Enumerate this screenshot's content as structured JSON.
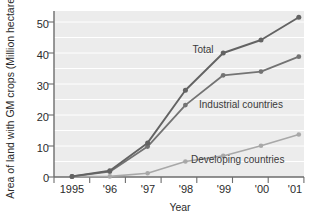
{
  "chart_data": {
    "type": "line",
    "title": "",
    "xlabel": "Year",
    "ylabel": "Area of land with GM crops (Million hectares)",
    "categories": [
      "1995",
      "'96",
      "'97",
      "'98",
      "'99",
      "'00",
      "'01"
    ],
    "x": [
      1995,
      1996,
      1997,
      1998,
      1999,
      2000,
      2001
    ],
    "xlim": [
      1995,
      2001
    ],
    "ylim": [
      0,
      55
    ],
    "yticks": [
      0,
      10,
      20,
      30,
      40,
      50
    ],
    "ytick_labels": [
      "0",
      "10",
      "20",
      "30",
      "40",
      "50"
    ],
    "grid": true,
    "grid_interval": 5,
    "legend_position": "inline-annotations",
    "series": [
      {
        "name": "Total",
        "color": "#636363",
        "values": [
          0.2,
          2.0,
          11.0,
          28.0,
          40.0,
          44.2,
          51.5
        ]
      },
      {
        "name": "Industrial countries",
        "color": "#737373",
        "values": [
          0.2,
          1.7,
          9.8,
          23.2,
          32.8,
          34.0,
          38.8
        ]
      },
      {
        "name": "Developing countries",
        "color": "#a8a8a8",
        "values": [
          0.1,
          0.2,
          1.2,
          5.0,
          6.8,
          10.1,
          13.7
        ]
      }
    ],
    "annotations": [
      {
        "text": "Total",
        "series": "Total",
        "x_px": 203,
        "y_px": 53
      },
      {
        "text": "Industrial countries",
        "series": "Industrial countries",
        "x_px": 199,
        "y_px": 108
      },
      {
        "text": "Developing countries",
        "series": "Developing countries",
        "x_px": 191,
        "y_px": 163
      }
    ]
  },
  "axes": {
    "y_axis_title": "Area of land with GM crops (Million hectares)",
    "x_axis_title": "Year",
    "y_tick_0": "0",
    "y_tick_1": "10",
    "y_tick_2": "20",
    "y_tick_3": "30",
    "y_tick_4": "40",
    "y_tick_5": "50",
    "x_tick_0": "1995",
    "x_tick_1": "'96",
    "x_tick_2": "'97",
    "x_tick_3": "'98",
    "x_tick_4": "'99",
    "x_tick_5": "'00",
    "x_tick_6": "'01"
  },
  "series_labels": {
    "total": "Total",
    "industrial": "Industrial countries",
    "developing": "Developing countries"
  },
  "colors": {
    "plot_background": "#ececec",
    "gridline": "#ffffff",
    "axis": "#6d6d6d",
    "total": "#636363",
    "industrial": "#737373",
    "developing": "#a8a8a8",
    "text": "#2b2b2b"
  }
}
